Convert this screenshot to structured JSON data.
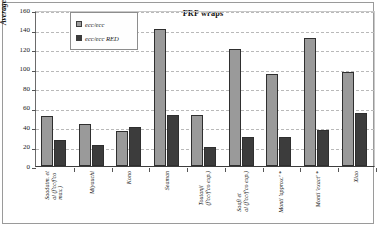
{
  "chart_data": {
    "type": "bar",
    "title": "FRP wraps",
    "xlabel": "",
    "ylabel": "Average absolute error (%)",
    "ylim": [
      0,
      160
    ],
    "ytick_step": 20,
    "yticks": [
      "0",
      "20",
      "40",
      "60",
      "80",
      "100",
      "120",
      "140",
      "160"
    ],
    "grid": true,
    "legend_position": "top-left-inside",
    "categories": [
      "Saadatm. et al (f'cc/f'co max.)",
      "Miyauchi",
      "Kono",
      "Seaman",
      "Toutanji (f'cc/f'co exp.)",
      "Saafi et al (f'cc/f'co exp.)",
      "Monti 'approx.' *",
      "Monti 'exact' *",
      "Xiao"
    ],
    "category_lines": [
      [
        "Saadatm. et",
        "al (f'cc/f'co",
        "max.)"
      ],
      [
        "Miyauchi"
      ],
      [
        "Kono"
      ],
      [
        "Seaman"
      ],
      [
        "Toutanji",
        "(f'cc/f'co exp.)"
      ],
      [
        "Saafi et",
        "al (f'cc/f'co exp.)"
      ],
      [
        "Monti 'approx.' *"
      ],
      [
        "Monti 'exact' *"
      ],
      [
        "Xiao"
      ]
    ],
    "series": [
      {
        "name": "ecc/ecc",
        "color": "#9a9a9a",
        "values": [
          51,
          43,
          36,
          141,
          52,
          120,
          94,
          131,
          96
        ]
      },
      {
        "name": "ecc/ecc RED",
        "color": "#3c3c3c",
        "values": [
          27,
          22,
          40,
          52,
          19,
          30,
          30,
          37,
          54
        ]
      }
    ]
  },
  "colors": {
    "series_a": "#9a9a9a",
    "series_b": "#3c3c3c",
    "grid": "#b9b9b9",
    "axis": "#3d3d3d",
    "background": "#ffffff"
  }
}
